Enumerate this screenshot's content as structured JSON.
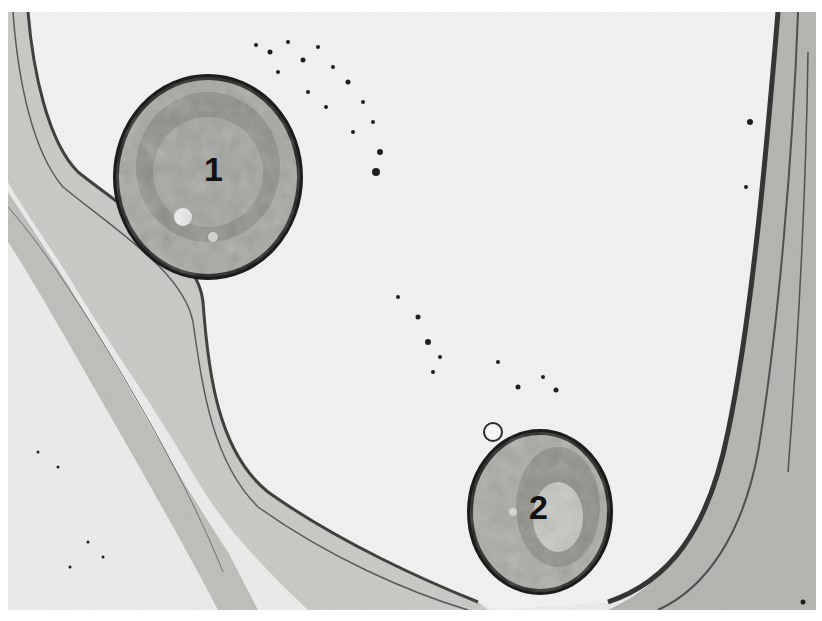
{
  "image": {
    "kind": "transmission electron micrograph",
    "description": "Capillary lumen bordered by endothelium; two cells within the lumen labeled with numerals",
    "labels": [
      {
        "id": "cell-1",
        "text": "1"
      },
      {
        "id": "cell-2",
        "text": "2"
      }
    ],
    "colors": {
      "background": "#e9e9e7",
      "lumen": "#f1f1ef",
      "wall": "#b9b9b6",
      "wall_dark": "#3a3a38",
      "cytoplasm": "#a9a9a5",
      "nucleus": "#8c8c88",
      "membrane": "#1c1c1a"
    }
  }
}
